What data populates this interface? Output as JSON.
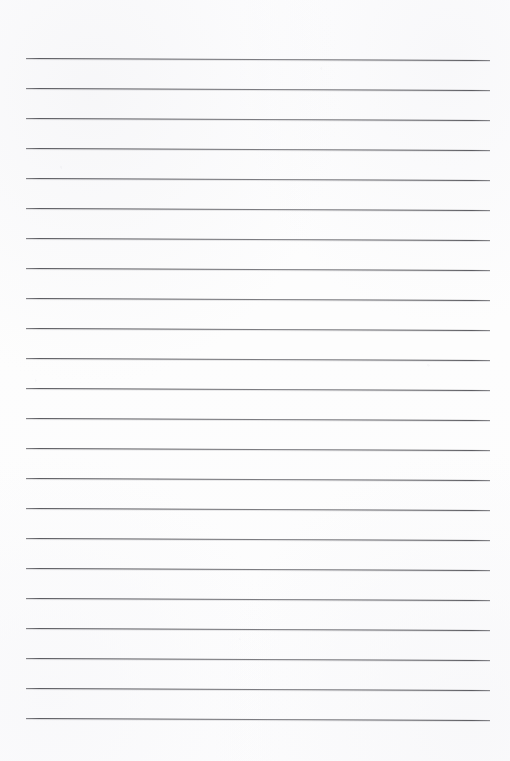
{
  "document": {
    "kind": "lined-paper-scan",
    "title": "Blank ruled notebook page",
    "page_width": 510,
    "page_height": 761,
    "background_color": "#fdfdfd",
    "content_text": "",
    "handwriting_present": "no",
    "printed_text_present": "no"
  },
  "ruling": {
    "line_color": "#4e4e54",
    "line_thickness_px": 1,
    "line_count": 23,
    "first_line_y": 58,
    "last_line_y": 718,
    "line_spacing_px": 30,
    "line_start_x": 26,
    "line_end_x": 490,
    "line_length_px": 464,
    "skew_degrees": 0.25,
    "margin_top_px": 58,
    "margin_bottom_px": 43,
    "margin_left_px": 26,
    "margin_right_px": 20,
    "lines": [
      {
        "index": 1,
        "y": 58,
        "x1": 26,
        "x2": 490
      },
      {
        "index": 2,
        "y": 88,
        "x1": 26,
        "x2": 490
      },
      {
        "index": 3,
        "y": 118,
        "x1": 26,
        "x2": 490
      },
      {
        "index": 4,
        "y": 148,
        "x1": 26,
        "x2": 490
      },
      {
        "index": 5,
        "y": 178,
        "x1": 26,
        "x2": 490
      },
      {
        "index": 6,
        "y": 208,
        "x1": 26,
        "x2": 490
      },
      {
        "index": 7,
        "y": 238,
        "x1": 26,
        "x2": 490
      },
      {
        "index": 8,
        "y": 268,
        "x1": 26,
        "x2": 490
      },
      {
        "index": 9,
        "y": 298,
        "x1": 26,
        "x2": 490
      },
      {
        "index": 10,
        "y": 328,
        "x1": 26,
        "x2": 490
      },
      {
        "index": 11,
        "y": 358,
        "x1": 26,
        "x2": 490
      },
      {
        "index": 12,
        "y": 388,
        "x1": 26,
        "x2": 490
      },
      {
        "index": 13,
        "y": 418,
        "x1": 26,
        "x2": 490
      },
      {
        "index": 14,
        "y": 448,
        "x1": 26,
        "x2": 490
      },
      {
        "index": 15,
        "y": 478,
        "x1": 26,
        "x2": 490
      },
      {
        "index": 16,
        "y": 508,
        "x1": 26,
        "x2": 490
      },
      {
        "index": 17,
        "y": 538,
        "x1": 26,
        "x2": 490
      },
      {
        "index": 18,
        "y": 568,
        "x1": 26,
        "x2": 490
      },
      {
        "index": 19,
        "y": 598,
        "x1": 26,
        "x2": 490
      },
      {
        "index": 20,
        "y": 628,
        "x1": 26,
        "x2": 490
      },
      {
        "index": 21,
        "y": 658,
        "x1": 26,
        "x2": 490
      },
      {
        "index": 22,
        "y": 688,
        "x1": 26,
        "x2": 490
      },
      {
        "index": 23,
        "y": 718,
        "x1": 26,
        "x2": 490
      }
    ]
  }
}
